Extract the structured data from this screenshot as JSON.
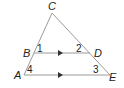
{
  "diagram": {
    "type": "triangle-with-parallel-lines",
    "points": {
      "C": {
        "label": "C",
        "x": 52,
        "y": 13
      },
      "B": {
        "label": "B",
        "x": 34,
        "y": 53
      },
      "D": {
        "label": "D",
        "x": 90,
        "y": 53
      },
      "A": {
        "label": "A",
        "x": 24,
        "y": 75
      },
      "E": {
        "label": "E",
        "x": 110,
        "y": 75
      }
    },
    "angles": [
      "1",
      "2",
      "3",
      "4"
    ],
    "segments": [
      "CA",
      "CE",
      "BD",
      "AE"
    ],
    "parallel": [
      "BD",
      "AE"
    ],
    "line_color": "#9a9a9a"
  }
}
